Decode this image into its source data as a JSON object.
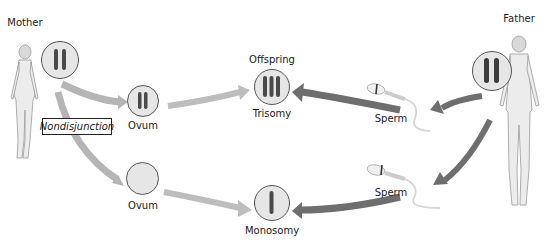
{
  "diagram": {
    "title_clipped": "",
    "parents": {
      "mother": {
        "label": "Mother"
      },
      "father": {
        "label": "Father"
      }
    },
    "process_label": "Nondisjunction",
    "gametes": {
      "ovum_top": {
        "label": "Ovum",
        "chromosomes": 2
      },
      "ovum_bottom": {
        "label": "Ovum",
        "chromosomes": 0
      },
      "sperm_top": {
        "label": "Sperm",
        "chromosomes": 1
      },
      "sperm_bottom": {
        "label": "Sperm",
        "chromosomes": 1
      }
    },
    "offspring": {
      "heading": "Offspring",
      "top": {
        "label": "Trisomy",
        "chromosomes": 3
      },
      "bottom": {
        "label": "Monosomy",
        "chromosomes": 1
      }
    },
    "colors": {
      "arrow_maternal": "#b5b5b5",
      "arrow_paternal": "#6e6e6e",
      "circle_fill": "#e6e6e6",
      "chromosome": "#4a4a4a",
      "skin": "#ececec"
    }
  }
}
